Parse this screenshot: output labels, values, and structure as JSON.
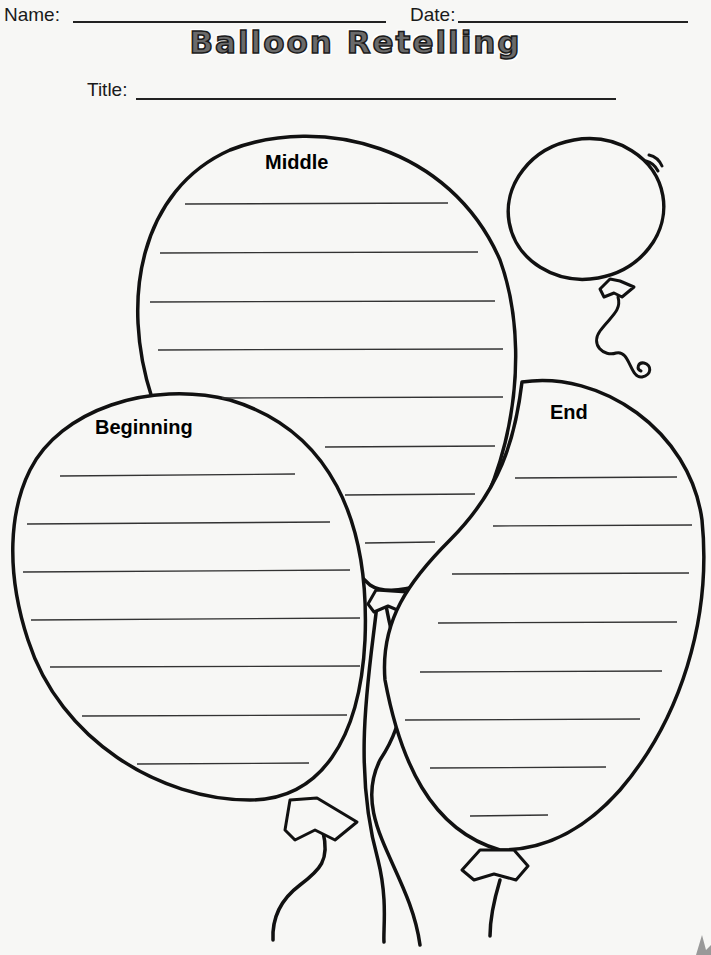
{
  "header": {
    "name_label": "Name:",
    "date_label": "Date:"
  },
  "worksheet": {
    "title": "Balloon Retelling",
    "title_field_label": "Title:"
  },
  "balloons": {
    "beginning": {
      "label": "Beginning",
      "line_count": 7
    },
    "middle": {
      "label": "Middle",
      "line_count": 8
    },
    "end": {
      "label": "End",
      "line_count": 8
    }
  },
  "colors": {
    "ink": "#111111",
    "paper": "#f7f7f5",
    "title_fill": "#6a6a6a"
  }
}
